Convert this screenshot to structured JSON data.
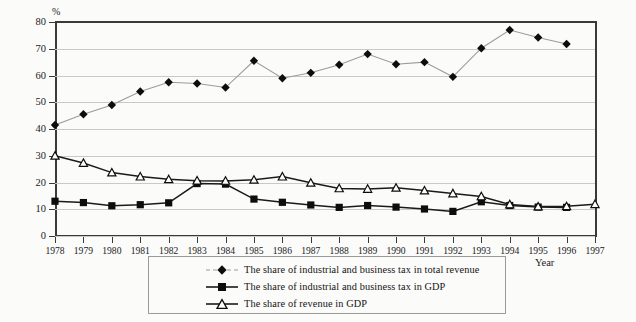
{
  "axes": {
    "y_unit_label": "%",
    "y_ticks": [
      "0",
      "10",
      "20",
      "30",
      "40",
      "50",
      "60",
      "70",
      "80"
    ],
    "x_axis_title": "Year",
    "x_ticks": [
      "1978",
      "1979",
      "1980",
      "1981",
      "1982",
      "1983",
      "1984",
      "1985",
      "1986",
      "1987",
      "1988",
      "1989",
      "1990",
      "1991",
      "1992",
      "1993",
      "1994",
      "1995",
      "1996",
      "1997"
    ]
  },
  "legend": {
    "items": [
      {
        "marker": "diamond-marker",
        "label": "The share of industrial and business tax in total revenue"
      },
      {
        "marker": "square-marker",
        "label": "The share of industrial and business tax in GDP"
      },
      {
        "marker": "triangle-marker",
        "label": "The share of revenue in GDP"
      }
    ]
  },
  "colors": {
    "axis": "#3a3a3a",
    "grid": "#c9c9c9",
    "series1_line": "#9b9b9b",
    "series1_marker": "#0d0d0d",
    "series2_line": "#1a1a1a",
    "series2_marker": "#0d0d0d",
    "series3_line": "#1a1a1a",
    "series3_marker": "#ffffff",
    "background": "#fbfbfa"
  },
  "chart_data": {
    "type": "line",
    "title": "",
    "xlabel": "Year",
    "ylabel": "%",
    "ylim": [
      0,
      80
    ],
    "ytick_step": 10,
    "grid": true,
    "legend_position": "bottom",
    "x": [
      1978,
      1979,
      1980,
      1981,
      1982,
      1983,
      1984,
      1985,
      1986,
      1987,
      1988,
      1989,
      1990,
      1991,
      1992,
      1993,
      1994,
      1995,
      1996,
      1997
    ],
    "series": [
      {
        "name": "The share of industrial and business tax in total revenue",
        "marker": "diamond",
        "values": [
          41.5,
          45.5,
          49.0,
          54.0,
          57.5,
          57.0,
          55.5,
          65.5,
          59.0,
          61.0,
          64.0,
          68.0,
          64.2,
          65.0,
          59.5,
          70.2,
          77.0,
          74.2,
          71.8,
          null
        ]
      },
      {
        "name": "The share of industrial and business tax in GDP",
        "marker": "square",
        "values": [
          13.0,
          12.5,
          11.3,
          11.7,
          12.4,
          19.6,
          19.4,
          13.8,
          12.6,
          11.6,
          10.7,
          11.4,
          10.8,
          10.1,
          9.2,
          12.8,
          11.4,
          10.8,
          10.7,
          null
        ]
      },
      {
        "name": "The share of revenue in GDP",
        "marker": "triangle",
        "values": [
          30.0,
          27.3,
          23.7,
          22.2,
          21.2,
          20.7,
          20.6,
          21.0,
          22.2,
          19.9,
          17.8,
          17.6,
          18.0,
          17.0,
          15.9,
          14.8,
          11.8,
          11.0,
          11.1,
          11.9
        ]
      }
    ]
  }
}
